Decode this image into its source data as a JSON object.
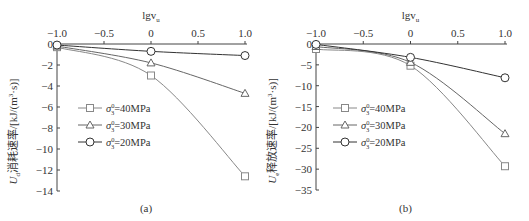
{
  "chart_data": [
    {
      "type": "line",
      "panel_label": "(a)",
      "title": "",
      "xlabel": "lgv_u",
      "ylabel": "U_d消耗速率/[kJ/(m³·s)]",
      "x": [
        -1.0,
        0,
        1.0
      ],
      "x_ticks": [
        "-1.0",
        "-0.5",
        "0",
        "0.5",
        "1.0"
      ],
      "y_ticks": [
        "0",
        "-2",
        "-4",
        "-6",
        "-8",
        "-10",
        "-12",
        "-14"
      ],
      "xlim": [
        -1.0,
        1.0
      ],
      "ylim": [
        -14,
        0
      ],
      "x_axis_position": "top",
      "grid": false,
      "legend_position": "left-center",
      "series": [
        {
          "name": "σ₃⁰=40MPa",
          "marker": "square",
          "color": "#888888",
          "values": [
            -0.3,
            -3.0,
            -12.6
          ]
        },
        {
          "name": "σ₃⁰=30MPa",
          "marker": "triangle",
          "color": "#666666",
          "values": [
            -0.2,
            -1.8,
            -4.7
          ]
        },
        {
          "name": "σ₃⁰=20MPa",
          "marker": "circle",
          "color": "#333333",
          "values": [
            -0.1,
            -0.7,
            -1.1
          ]
        }
      ]
    },
    {
      "type": "line",
      "panel_label": "(b)",
      "title": "",
      "xlabel": "lgv_u",
      "ylabel": "U_e释放速率/[kJ/(m³·s)]",
      "x": [
        -1.0,
        0,
        1.0
      ],
      "x_ticks": [
        "-1.0",
        "-0.5",
        "0",
        "0.5",
        "1.0"
      ],
      "y_ticks": [
        "0",
        "-5",
        "-10",
        "-15",
        "-20",
        "-25",
        "-30",
        "-35"
      ],
      "xlim": [
        -1.0,
        1.0
      ],
      "ylim": [
        -35,
        0
      ],
      "x_axis_position": "top",
      "grid": false,
      "legend_position": "left-center",
      "series": [
        {
          "name": "σ₃⁰=40MPa",
          "marker": "square",
          "color": "#888888",
          "values": [
            -1.2,
            -5.2,
            -29.3
          ]
        },
        {
          "name": "σ₃⁰=30MPa",
          "marker": "triangle",
          "color": "#666666",
          "values": [
            -0.6,
            -4.4,
            -21.5
          ]
        },
        {
          "name": "σ₃⁰=20MPa",
          "marker": "circle",
          "color": "#333333",
          "values": [
            -0.1,
            -3.2,
            -8.1
          ]
        }
      ]
    }
  ],
  "panels": {
    "a": {
      "label": "(a)",
      "xlabel_main": "lgv",
      "xlabel_sub": "u",
      "ylabel_var": "U",
      "ylabel_sub": "d",
      "ylabel_rest": "消耗速率/[kJ/(m",
      "ylabel_sup": "3",
      "ylabel_end": "·s)]",
      "legend": [
        {
          "sym": "σ",
          "sub": "3",
          "sup": "0",
          "text": "=40MPa"
        },
        {
          "sym": "σ",
          "sub": "3",
          "sup": "0",
          "text": "=30MPa"
        },
        {
          "sym": "σ",
          "sub": "3",
          "sup": "0",
          "text": "=20MPa"
        }
      ]
    },
    "b": {
      "label": "(b)",
      "xlabel_main": "lgv",
      "xlabel_sub": "u",
      "ylabel_var": "U",
      "ylabel_sub": "e",
      "ylabel_rest": "释放速率/[kJ/(m",
      "ylabel_sup": "3",
      "ylabel_end": "·s)]",
      "legend": [
        {
          "sym": "σ",
          "sub": "3",
          "sup": "0",
          "text": "=40MPa"
        },
        {
          "sym": "σ",
          "sub": "3",
          "sup": "0",
          "text": "=30MPa"
        },
        {
          "sym": "σ",
          "sub": "3",
          "sup": "0",
          "text": "=20MPa"
        }
      ]
    }
  }
}
